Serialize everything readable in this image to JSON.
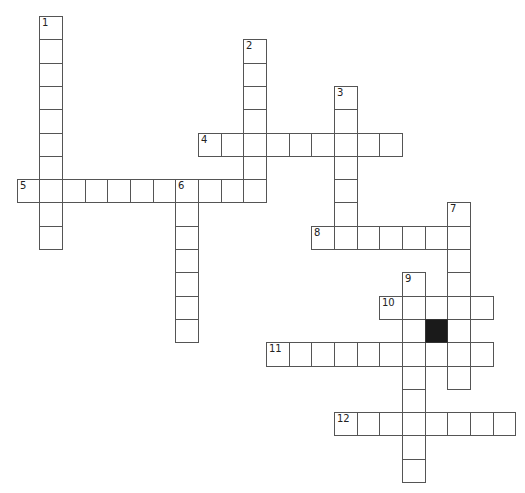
{
  "puzzle": {
    "type": "crossword",
    "grid": {
      "origin_x": 16.7,
      "origin_y": 16,
      "cell_w": 22.66,
      "cell_h": 23.3
    },
    "colors": {
      "cell_fill": "#ffffff",
      "cell_border": "#555555",
      "block_fill": "#1a1a1a"
    },
    "entries": [
      {
        "number": "1",
        "direction": "down",
        "col": 1,
        "row": 0,
        "length": 10
      },
      {
        "number": "2",
        "direction": "down",
        "col": 10,
        "row": 1,
        "length": 7
      },
      {
        "number": "3",
        "direction": "down",
        "col": 14,
        "row": 3,
        "length": 7
      },
      {
        "number": "4",
        "direction": "across",
        "col": 8,
        "row": 5,
        "length": 9
      },
      {
        "number": "5",
        "direction": "across",
        "col": 0,
        "row": 7,
        "length": 11
      },
      {
        "number": "6",
        "direction": "down",
        "col": 7,
        "row": 7,
        "length": 7
      },
      {
        "number": "7",
        "direction": "down",
        "col": 19,
        "row": 8,
        "length": 8
      },
      {
        "number": "8",
        "direction": "across",
        "col": 13,
        "row": 9,
        "length": 7
      },
      {
        "number": "9",
        "direction": "down",
        "col": 17,
        "row": 11,
        "length": 9
      },
      {
        "number": "10",
        "direction": "across",
        "col": 16,
        "row": 12,
        "length": 5
      },
      {
        "number": "11",
        "direction": "across",
        "col": 11,
        "row": 14,
        "length": 10
      },
      {
        "number": "12",
        "direction": "across",
        "col": 14,
        "row": 17,
        "length": 8
      }
    ],
    "blocks": [
      {
        "col": 18,
        "row": 13
      }
    ]
  }
}
